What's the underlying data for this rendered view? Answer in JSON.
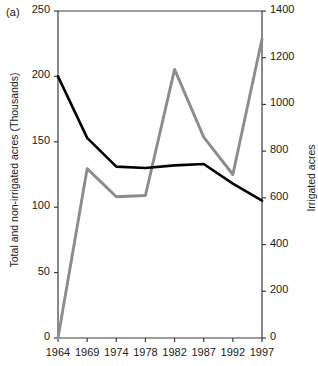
{
  "figure": {
    "panel_label": "(a)"
  },
  "chart_data": {
    "type": "line",
    "title": "",
    "xlabel": "",
    "ylabel": "Total and non-irrigated acres (Thousands)",
    "y2label": "Irrigated acres",
    "grid": false,
    "legend": "none",
    "categories": [
      "1964",
      "1969",
      "1974",
      "1978",
      "1982",
      "1987",
      "1992",
      "1997"
    ],
    "x_tick_labels": [
      "1964",
      "1969",
      "1974",
      "1978",
      "1982",
      "1987",
      "1992",
      "1997"
    ],
    "y_tick_labels": [
      "0",
      "50",
      "100",
      "150",
      "200",
      "250"
    ],
    "y_tick_values": [
      0,
      50,
      100,
      150,
      200,
      250
    ],
    "ylim": [
      0,
      250
    ],
    "y2_tick_labels": [
      "0",
      "200",
      "400",
      "600",
      "800",
      "1000",
      "1200",
      "1400"
    ],
    "y2_tick_values": [
      0,
      200,
      400,
      600,
      800,
      1000,
      1200,
      1400
    ],
    "y2lim": [
      0,
      1400
    ],
    "series": [
      {
        "name": "Total and non-irrigated acres (Thousands)",
        "axis": "left",
        "color": "#000000",
        "values": [
          200,
          153,
          131,
          130,
          132,
          133,
          118,
          105
        ]
      },
      {
        "name": "Irrigated acres",
        "axis": "right",
        "color": "#8c8c8c",
        "values": [
          0,
          725,
          605,
          610,
          1150,
          860,
          700,
          1280
        ]
      }
    ]
  }
}
